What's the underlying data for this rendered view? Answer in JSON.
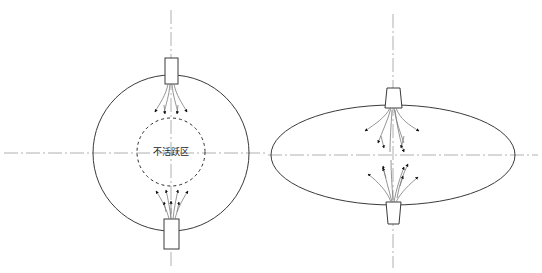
{
  "figure": {
    "title": "",
    "background_color": "#ffffff",
    "width": 542,
    "height": 273
  },
  "styles": {
    "vessel_stroke": "#3a3a3a",
    "vessel_stroke_width": 1.0,
    "centerline_stroke": "#b0b0b0",
    "centerline_width": 1.0,
    "centerline_dash": "14,3,2,3",
    "dashed_zone_stroke": "#2b2b2b",
    "dashed_zone_width": 1.0,
    "dashed_zone_dash": "3,3",
    "streamline_stroke": "#7a7a7a",
    "streamline_width": 0.8,
    "arrow_fill": "#111111",
    "nozzle_stroke": "#3a3a3a",
    "nozzle_fill": "#ffffff",
    "label_color": "#1a1a1a"
  },
  "panels": [
    {
      "id": "left-panel",
      "name": "spherical-vessel",
      "vessel_shape": "circle",
      "center": {
        "x": 171,
        "y": 153
      },
      "radius": 78,
      "has_inactive_zone": true,
      "inactive_zone": {
        "label": "不活跃区",
        "center": {
          "x": 171,
          "y": 152
        },
        "radius": 34,
        "label_x": 171,
        "label_y": 152
      },
      "top_nozzle": {
        "x": 165,
        "y": 58,
        "width": 13,
        "height": 26
      },
      "bottom_nozzle": {
        "x": 164,
        "y": 219,
        "width": 15,
        "height": 30
      },
      "vertical_axis": {
        "x": 171,
        "y1": 10,
        "y2": 266
      },
      "horizontal_axis": {
        "y": 153,
        "x1": 4,
        "x2": 268
      }
    },
    {
      "id": "right-panel",
      "name": "ellipsoidal-vessel",
      "vessel_shape": "ellipse",
      "center": {
        "x": 393,
        "y": 155
      },
      "radius_x": 122,
      "radius_y": 50,
      "has_inactive_zone": false,
      "inactive_zone": null,
      "top_nozzle": {
        "x": 386,
        "y": 88,
        "width": 15,
        "height": 20
      },
      "bottom_nozzle": {
        "x": 386,
        "y": 202,
        "width": 15,
        "height": 22
      },
      "vertical_axis": {
        "x": 393,
        "y1": 14,
        "y2": 268
      },
      "horizontal_axis": {
        "y": 155,
        "x1": 268,
        "x2": 538
      }
    }
  ],
  "flow": {
    "description_left_upper": "jet diverging downward from top nozzle toward inactive zone",
    "description_left_lower": "flow converging upward from bottom nozzle toward inactive zone",
    "description_right": "continuous hourglass flow between top and bottom nozzles"
  }
}
